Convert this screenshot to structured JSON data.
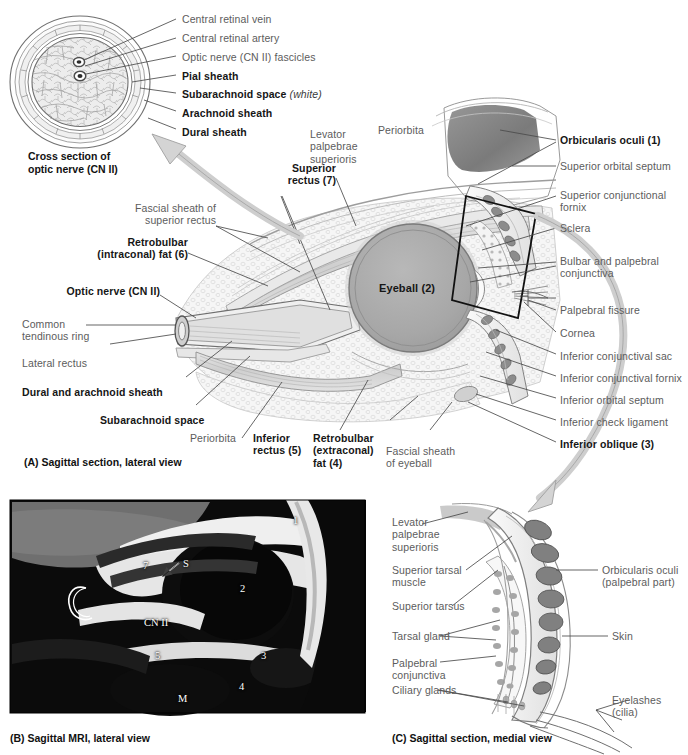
{
  "figure": {
    "colors": {
      "leader_line": "#4a4a4a",
      "label_text": "#5c5c5c",
      "bold_label_text": "#161616",
      "eyeball_fill": "#a8a8a8",
      "arrow_fill": "#d4d4d4",
      "arrow_stroke": "#a0a0a0",
      "tissue_light": "#f2f2f2",
      "tissue_mid": "#d8d8d8",
      "tissue_dark": "#8e8e8e",
      "highlight_box": "#111111",
      "mri_background": "#0c0c0c"
    }
  },
  "panel_cross_section": {
    "title_line1": "Cross section of",
    "title_line2": "optic nerve (CN II)",
    "labels": [
      {
        "text": "Central retinal vein",
        "bold": false
      },
      {
        "text": "Central retinal artery",
        "bold": false
      },
      {
        "text": "Optic nerve (CN II) fascicles",
        "bold": false
      },
      {
        "text": "Pial sheath",
        "bold": true
      },
      {
        "text": "Subarachnoid space",
        "bold": true,
        "suffix": "(white)",
        "suffix_italic": true
      },
      {
        "text": "Arachnoid sheath",
        "bold": true
      },
      {
        "text": "Dural sheath",
        "bold": true
      }
    ]
  },
  "panel_a": {
    "caption": "(A) Sagittal section, lateral view",
    "center_label": "Eyeball (2)",
    "labels_left": [
      {
        "text": "Fascial sheath of\nsuperior rectus",
        "bold": false
      },
      {
        "text": "Retrobulbar\n(intraconal) fat (6)",
        "bold": true
      },
      {
        "text": "Optic nerve (CN II)",
        "bold": true
      },
      {
        "text": "Common\ntendinous ring",
        "bold": false
      },
      {
        "text": "Lateral rectus",
        "bold": false
      },
      {
        "text": "Dural and arachnoid sheath",
        "bold": true
      },
      {
        "text": "Subarachnoid space",
        "bold": true
      },
      {
        "text": "Periorbita",
        "bold": false
      }
    ],
    "labels_top": [
      {
        "text": "Superior\nrectus (7)",
        "bold": true
      },
      {
        "text": "Levator\npalpebrae\nsuperioris",
        "bold": false
      },
      {
        "text": "Periorbita",
        "bold": false
      }
    ],
    "labels_bottom": [
      {
        "text": "Inferior\nrectus (5)",
        "bold": true
      },
      {
        "text": "Retrobulbar\n(extraconal)\nfat (4)",
        "bold": true
      },
      {
        "text": "Fascial sheath\nof eyeball",
        "bold": false
      }
    ],
    "labels_right": [
      {
        "text": "Orbicularis oculi (1)",
        "bold": true
      },
      {
        "text": "Superior orbital septum",
        "bold": false
      },
      {
        "text": "Superior conjunctional\nfornix",
        "bold": false
      },
      {
        "text": "Sclera",
        "bold": false
      },
      {
        "text": "Bulbar and palpebral\nconjunctiva",
        "bold": false
      },
      {
        "text": "Palpebral fissure",
        "bold": false
      },
      {
        "text": "Cornea",
        "bold": false
      },
      {
        "text": "Inferior conjunctival sac",
        "bold": false
      },
      {
        "text": "Inferior conjunctival fornix",
        "bold": false
      },
      {
        "text": "Inferior orbital septum",
        "bold": false
      },
      {
        "text": "Inferior check ligament",
        "bold": false
      },
      {
        "text": "Inferior oblique (3)",
        "bold": true
      }
    ]
  },
  "panel_b": {
    "caption": "(B) Sagittal MRI, lateral view",
    "annotations": [
      {
        "text": "1",
        "dark": false
      },
      {
        "text": "7",
        "dark": false
      },
      {
        "text": "S",
        "dark": false
      },
      {
        "text": "2",
        "dark": false
      },
      {
        "text": "C",
        "dark": false
      },
      {
        "text": "CN II",
        "dark": false
      },
      {
        "text": "5",
        "dark": false
      },
      {
        "text": "3",
        "dark": false
      },
      {
        "text": "4",
        "dark": false
      },
      {
        "text": "M",
        "dark": false
      }
    ]
  },
  "panel_c": {
    "caption": "(C) Sagittal section, medial view",
    "labels_left": [
      {
        "text": "Levator\npalpebrae\nsuperioris",
        "bold": false
      },
      {
        "text": "Superior tarsal\nmuscle",
        "bold": false
      },
      {
        "text": "Superior tarsus",
        "bold": false
      },
      {
        "text": "Tarsal gland",
        "bold": false
      },
      {
        "text": "Palpebral\nconjunctiva",
        "bold": false
      },
      {
        "text": "Ciliary glands",
        "bold": false
      }
    ],
    "labels_right": [
      {
        "text": "Orbicularis oculi\n(palpebral part)",
        "bold": false
      },
      {
        "text": "Skin",
        "bold": false
      },
      {
        "text": "Eyelashes\n(cilia)",
        "bold": false
      }
    ]
  }
}
